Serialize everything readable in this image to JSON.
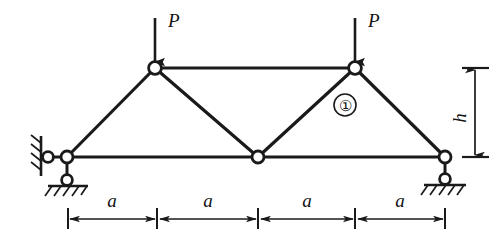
{
  "figure": {
    "background_color": "#ffffff",
    "line_color": "#1a1a1a",
    "node_fill": "#ffffff"
  },
  "labels": {
    "load_left": "P",
    "load_right": "P",
    "member_marker": "①",
    "height": "h",
    "span_1": "a",
    "span_2": "a",
    "span_3": "a",
    "span_4": "a"
  },
  "structure": {
    "nodes": [
      {
        "name": "bottom-left-support-node",
        "x": 67,
        "y": 157
      },
      {
        "name": "bottom-center-node",
        "x": 258,
        "y": 157
      },
      {
        "name": "bottom-right-support-node",
        "x": 445,
        "y": 157
      },
      {
        "name": "top-left-node",
        "x": 155,
        "y": 68
      },
      {
        "name": "top-right-node",
        "x": 355,
        "y": 68
      },
      {
        "name": "left-wall-pin",
        "x": 48,
        "y": 157
      },
      {
        "name": "left-ground-pin",
        "x": 67,
        "y": 180
      },
      {
        "name": "right-ground-pin",
        "x": 445,
        "y": 179
      }
    ],
    "members": [
      {
        "name": "bottom-chord-left",
        "x1": 67,
        "y1": 157,
        "x2": 258,
        "y2": 157
      },
      {
        "name": "bottom-chord-right",
        "x1": 258,
        "y1": 157,
        "x2": 445,
        "y2": 157
      },
      {
        "name": "top-chord",
        "x1": 155,
        "y1": 68,
        "x2": 355,
        "y2": 68
      },
      {
        "name": "left-end-post",
        "x1": 67,
        "y1": 157,
        "x2": 155,
        "y2": 68
      },
      {
        "name": "diagonal-left",
        "x1": 155,
        "y1": 68,
        "x2": 258,
        "y2": 157
      },
      {
        "name": "diagonal-right",
        "x1": 258,
        "y1": 157,
        "x2": 355,
        "y2": 68
      },
      {
        "name": "right-end-post",
        "x1": 355,
        "y1": 68,
        "x2": 445,
        "y2": 157
      }
    ]
  },
  "dimensions": {
    "baseline_y": 218,
    "ticks_x": [
      68,
      157,
      258,
      355,
      445
    ],
    "height_line_x": 475,
    "height_top_y": 68,
    "height_bottom_y": 157
  },
  "loads": [
    {
      "name": "load-arrow-left",
      "x": 155,
      "y_start": 18,
      "y_end": 62,
      "label": "P"
    },
    {
      "name": "load-arrow-right",
      "x": 355,
      "y_start": 18,
      "y_end": 62,
      "label": "P"
    }
  ]
}
